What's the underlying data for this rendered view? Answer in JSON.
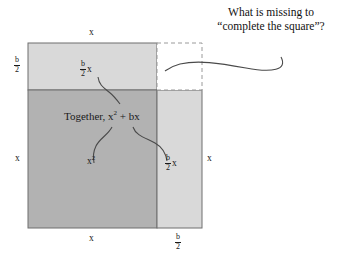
{
  "figure": {
    "title_note": "Completing the square area diagram",
    "callout": {
      "name": "callout-question",
      "line1": "What is missing to",
      "line2": "“complete the square”?"
    },
    "labels": {
      "top_x": "x",
      "bottom_x": "x",
      "left_x": "x",
      "right_x": "x",
      "left_half_b_num": "b",
      "left_half_b_den": "2",
      "bottom_half_b_num": "b",
      "bottom_half_b_den": "2",
      "top_strip_num": "b",
      "top_strip_den": "2",
      "top_strip_var": "x",
      "right_strip_num": "b",
      "right_strip_den": "2",
      "right_strip_var": "x",
      "square_term_base": "x",
      "square_term_exp": "2",
      "together": "Together, x",
      "together_exp": "2",
      "together_tail": " + bx"
    },
    "colors": {
      "dark_fill": "#b3b3b3",
      "light_fill": "#d9d9d9",
      "missing_fill": "#ffffff",
      "stroke": "#555555",
      "dashed_stroke": "#8c8c8c",
      "text": "#1a1a1a",
      "background": "#ffffff"
    },
    "geometry": {
      "big_square": {
        "x": 28,
        "y": 90,
        "width": 129,
        "height": 138
      },
      "top_strip": {
        "x": 28,
        "y": 43,
        "width": 129,
        "height": 47
      },
      "right_strip": {
        "x": 157,
        "y": 90,
        "width": 45,
        "height": 138
      },
      "missing_square": {
        "x": 157,
        "y": 43,
        "width": 45,
        "height": 47
      }
    },
    "regions": [
      {
        "name": "x-squared-region",
        "label": "x²",
        "fill": "dark"
      },
      {
        "name": "top-strip-region",
        "label": "(b/2)x",
        "fill": "light"
      },
      {
        "name": "right-strip-region",
        "label": "(b/2)x",
        "fill": "light"
      },
      {
        "name": "missing-square-region",
        "label": "",
        "fill": "none"
      }
    ]
  }
}
